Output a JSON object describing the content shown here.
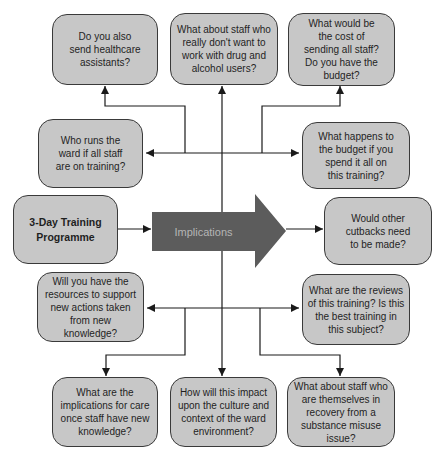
{
  "diagram": {
    "center_arrow": {
      "label": "Implications"
    },
    "boxes": [
      {
        "text": "Do you also\nsend healthcare\nassistants?"
      },
      {
        "text": "What about staff who\nreally don't want to\nwork with drug and\nalcohol users?"
      },
      {
        "text": "What would be\nthe cost of\nsending all staff?\nDo you have the\nbudget?"
      },
      {
        "text": "Who runs the\nward if all staff\nare on training?"
      },
      {
        "text": "What happens to\nthe budget if you\nspend it all on\nthis training?"
      },
      {
        "text": "3-Day Training\nProgramme"
      },
      {
        "text": "Would other\ncutbacks need\nto be made?"
      },
      {
        "text": "Will you have the\nresources to support\nnew actions taken\nfrom new\nknowledge?"
      },
      {
        "text": "What are the reviews\nof this training? Is this\nthe best training in\nthis subject?"
      },
      {
        "text": "What are the\nimplications for care\nonce staff have new\nknowledge?"
      },
      {
        "text": "How will this impact\nupon the culture and\ncontext of the ward\nenvironment?"
      },
      {
        "text": "What about staff who\nare themselves in\nrecovery from a\nsubstance misuse\nissue?"
      }
    ]
  },
  "colors": {
    "background": "#ffffff",
    "box_fill": "#c7c7c7",
    "box_border": "#3a3a3a",
    "text_color": "#1f1f1f",
    "arrow_fill": "#5c5c5c",
    "arrow_text": "#b5b5b5",
    "connector_color": "#1a1a1a"
  }
}
